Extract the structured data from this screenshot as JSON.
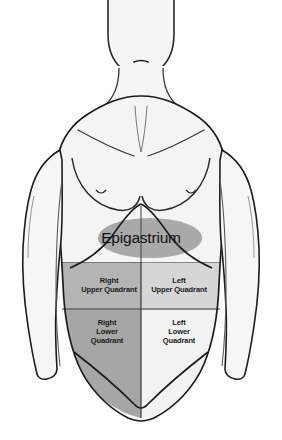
{
  "diagram": {
    "regions": {
      "epigastrium": {
        "label": "Epigastrium",
        "shape": "ellipse",
        "fill": "#a8a8a8"
      },
      "right_upper_quadrant": {
        "label": "Right\nUpper Quadrant",
        "fill": "#b4b4b4"
      },
      "left_upper_quadrant": {
        "label": "Left\nUpper Quadrant",
        "fill": "#d6d6d6"
      },
      "right_lower_quadrant": {
        "label": "Right\nLower\nQuadrant",
        "fill": "#a6a6a6"
      },
      "left_lower_quadrant": {
        "label": "Left\nLower\nQuadrant",
        "fill": "#f2f2f2"
      }
    },
    "colors": {
      "background": "#ffffff",
      "body_fill": "#f4f4f4",
      "body_outline": "#1c1c1c",
      "inner_line": "#4a4a4a",
      "quadrant_divider": "#3a3a3a",
      "text": "#111111"
    }
  }
}
